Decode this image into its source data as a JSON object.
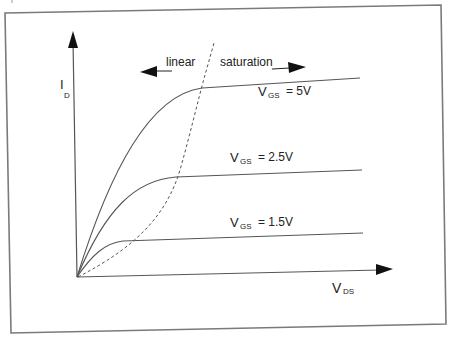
{
  "diagram": {
    "y_axis": {
      "label": "I",
      "subscript": "D"
    },
    "x_axis": {
      "label": "V",
      "subscript": "DS"
    },
    "regions": {
      "linear": "linear",
      "saturation": "saturation"
    },
    "curves": [
      {
        "name": "vgs-5v",
        "label_main": "V",
        "label_sub": "GS",
        "label_value": "= 5V"
      },
      {
        "name": "vgs-2.5v",
        "label_main": "V",
        "label_sub": "GS",
        "label_value": "= 2.5V"
      },
      {
        "name": "vgs-1.5v",
        "label_main": "V",
        "label_sub": "GS",
        "label_value": "= 1.5V"
      }
    ],
    "colors": {
      "line": "#555555",
      "frame": "#777777",
      "text": "#222222",
      "arrow": "#111111"
    }
  }
}
